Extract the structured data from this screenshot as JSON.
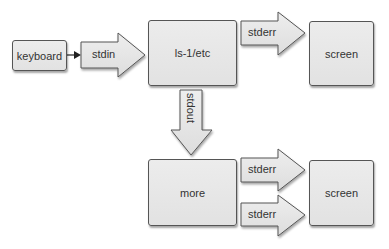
{
  "diagram": {
    "nodes": {
      "keyboard": "keyboard",
      "ls": "ls-1/etc",
      "screen_top": "screen",
      "more": "more",
      "screen_bottom": "screen"
    },
    "edges": {
      "stdin": "stdin",
      "stderr_top": "stderr",
      "stdout": "stdout",
      "stderr_bottom_1": "stderr",
      "stderr_bottom_2": "stderr"
    },
    "colors": {
      "box_fill": "#e6e6e6",
      "border": "#555555",
      "text": "#333333"
    }
  }
}
